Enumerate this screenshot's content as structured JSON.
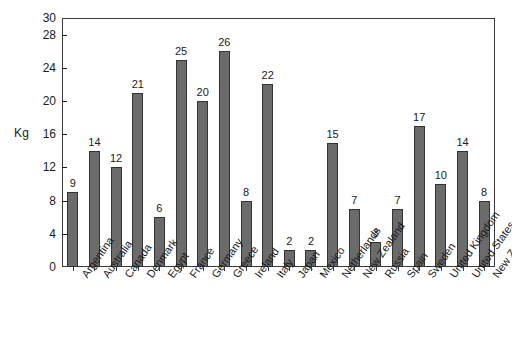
{
  "chart_data": {
    "type": "bar",
    "title": "",
    "xlabel": "",
    "ylabel": "Kg",
    "ylim": [
      0,
      30
    ],
    "grid": false,
    "legend": false,
    "orientation": "vertical",
    "bar_color": "#6b6b6b",
    "bar_edge_color": "#333333",
    "value_labels_shown": true,
    "ytick_labels": [
      "0",
      "4",
      "8",
      "12",
      "16",
      "20",
      "24",
      "28",
      "30"
    ],
    "yticks": [
      0,
      4,
      8,
      12,
      16,
      20,
      24,
      28,
      30
    ],
    "categories": [
      "Argentina",
      "Australia",
      "Canada",
      "Denmark",
      "Egypt",
      "France",
      "Germany",
      "Greece",
      "Ireland",
      "Italy",
      "Japan",
      "Mexico",
      "Netherlands",
      "New Zealand",
      "Russia",
      "Spain",
      "Sweden",
      "United Kingdom",
      "United States",
      "New Zealand"
    ],
    "values": [
      9,
      14,
      12,
      21,
      6,
      25,
      20,
      26,
      8,
      22,
      2,
      2,
      15,
      7,
      3,
      7,
      17,
      10,
      14,
      8
    ]
  }
}
